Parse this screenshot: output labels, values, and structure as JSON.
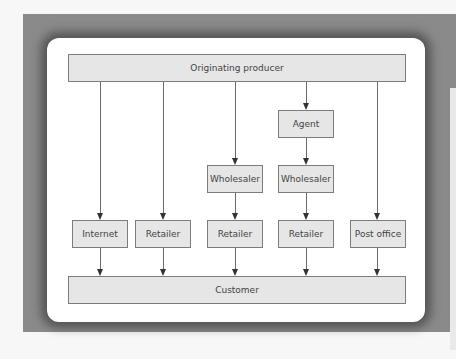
{
  "diagram": {
    "top": {
      "label": "Originating producer"
    },
    "bottom": {
      "label": "Customer"
    },
    "channels": [
      {
        "name": "internet",
        "nodes": [
          "Internet"
        ]
      },
      {
        "name": "retailer",
        "nodes": [
          "Retailer"
        ]
      },
      {
        "name": "wholesaler-retailer",
        "nodes": [
          "Wholesaler",
          "Retailer"
        ]
      },
      {
        "name": "agent-wholesaler-retailer",
        "nodes": [
          "Agent",
          "Wholesaler",
          "Retailer"
        ]
      },
      {
        "name": "post-office",
        "nodes": [
          "Post office"
        ]
      }
    ],
    "colors": {
      "box_fill": "#e6e6e6",
      "box_border": "#7c7c7c",
      "frame": "#8a8a8a",
      "card": "#ffffff"
    }
  }
}
